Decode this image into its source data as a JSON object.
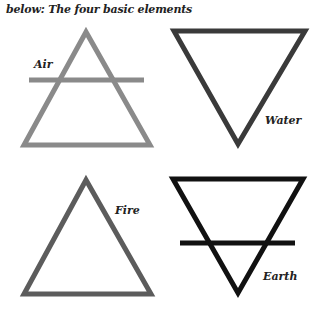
{
  "caption": "below: The four basic elements",
  "elements": [
    {
      "name": "Air",
      "symbol": "upward-triangle-with-bar",
      "color": "#8a8a8a"
    },
    {
      "name": "Water",
      "symbol": "downward-triangle",
      "color": "#3a3a3a"
    },
    {
      "name": "Fire",
      "symbol": "upward-triangle",
      "color": "#5c5c5c"
    },
    {
      "name": "Earth",
      "symbol": "downward-triangle-with-bar",
      "color": "#111111"
    }
  ]
}
